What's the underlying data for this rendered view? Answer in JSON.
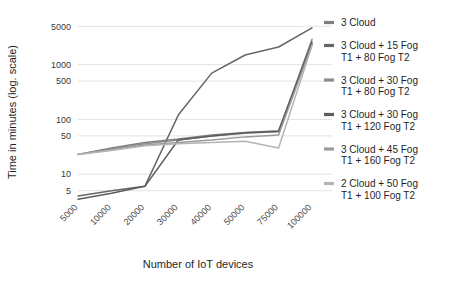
{
  "chart_data": {
    "type": "line",
    "title": "",
    "xlabel": "Number of IoT devices",
    "ylabel": "Time in minutes (log. scale)",
    "yscale": "log",
    "ylim": [
      4,
      6000
    ],
    "grid": true,
    "legend_position": "right",
    "ytick_labels": [
      "5000",
      "1000",
      "500",
      "100",
      "50",
      "10",
      "5"
    ],
    "ytick_values": [
      5000,
      1000,
      500,
      100,
      50,
      10,
      5
    ],
    "categories": [
      "5000",
      "10000",
      "20000",
      "30000",
      "40000",
      "50000",
      "75000",
      "100000"
    ],
    "series": [
      {
        "name": "3 Cloud",
        "color": "#7f7f7f",
        "values": [
          23,
          30,
          38,
          44,
          52,
          58,
          62,
          2400
        ]
      },
      {
        "name": "3 Cloud  + 15 Fog T1 + 80 Fog T2",
        "color": "#666666",
        "values": [
          4,
          5,
          6,
          120,
          700,
          1500,
          2100,
          4700
        ]
      },
      {
        "name": "3 Cloud + 30 Fog T1 + 80 Fog T2",
        "color": "#8c8c8c",
        "values": [
          23,
          29,
          36,
          42,
          50,
          56,
          60,
          2900
        ]
      },
      {
        "name": "3 Cloud + 30 Fog T1 + 120 Fog T2",
        "color": "#5c5c5c",
        "values": [
          3.5,
          4.5,
          6,
          42,
          50,
          57,
          60,
          2600
        ]
      },
      {
        "name": "3 Cloud + 45 Fog T1 + 160 Fog T2",
        "color": "#9a9a9a",
        "values": [
          23,
          28,
          34,
          38,
          42,
          48,
          52,
          2300
        ]
      },
      {
        "name": "2 Cloud + 50 Fog T1 + 100 Fog T2",
        "color": "#b4b4b4",
        "values": [
          23,
          27,
          33,
          36,
          38,
          40,
          30,
          2200
        ]
      }
    ]
  },
  "legend": {
    "items": [
      {
        "label_line1": "3 Cloud",
        "label_line2": ""
      },
      {
        "label_line1": "3 Cloud  + 15 Fog",
        "label_line2": "T1 + 80 Fog T2"
      },
      {
        "label_line1": "3 Cloud + 30 Fog",
        "label_line2": "T1 + 80 Fog T2"
      },
      {
        "label_line1": "3 Cloud + 30 Fog",
        "label_line2": "T1 + 120 Fog T2"
      },
      {
        "label_line1": "3 Cloud + 45 Fog",
        "label_line2": "T1 + 160 Fog T2"
      },
      {
        "label_line1": "2 Cloud + 50 Fog",
        "label_line2": "T1 + 100 Fog T2"
      }
    ]
  }
}
